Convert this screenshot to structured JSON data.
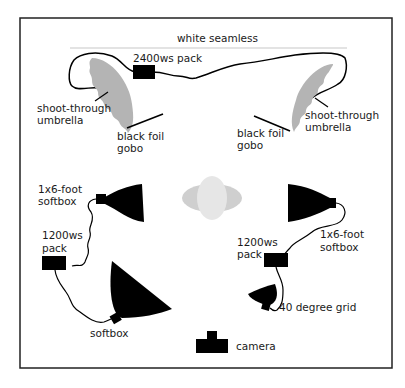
{
  "diagram": {
    "type": "lighting-setup",
    "labels": {
      "backdrop": "white seamless",
      "main_pack": "2400ws pack",
      "umbrella_left_1": "shoot-through",
      "umbrella_left_2": "umbrella",
      "umbrella_right_1": "shoot-through",
      "umbrella_right_2": "umbrella",
      "gobo_left_1": "black foil",
      "gobo_left_2": "gobo",
      "gobo_right_1": "black foil",
      "gobo_right_2": "gobo",
      "softbox_left_1": "1x6-foot",
      "softbox_left_2": "softbox",
      "softbox_right_1": "1x6-foot",
      "softbox_right_2": "softbox",
      "pack_left_1": "1200ws",
      "pack_left_2": "pack",
      "pack_right_1": "1200ws",
      "pack_right_2": "pack",
      "front_softbox": "softbox",
      "grid": "40 degree grid",
      "camera": "camera"
    },
    "colors": {
      "border": "#222222",
      "equipment": "#000000",
      "umbrella": "#b4b4b4",
      "subject_outer": "#cfcfcf",
      "subject_inner": "#e6e6e6",
      "seamless_line": "#c8c8c8"
    }
  }
}
